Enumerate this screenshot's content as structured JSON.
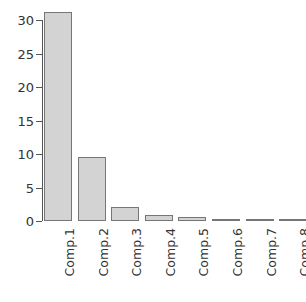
{
  "chart_data": {
    "type": "bar",
    "title": "",
    "subtitle": "",
    "xlabel": "",
    "ylabel": "",
    "categories": [
      "Comp.1",
      "Comp.2",
      "Comp.3",
      "Comp.4",
      "Comp.5",
      "Comp.6",
      "Comp.7",
      "Comp.8",
      "Comp.9",
      "Comp.10"
    ],
    "values": [
      31.2,
      9.5,
      2.1,
      0.85,
      0.62,
      0.3,
      0.25,
      0.18,
      0.12,
      0.08
    ],
    "ylim": [
      0,
      31.5
    ],
    "yticks": [
      0,
      5,
      10,
      15,
      20,
      25,
      30
    ],
    "ytick_labels": [
      "0",
      "5",
      "10",
      "15",
      "20",
      "25",
      "30"
    ],
    "grid": false,
    "legend": null,
    "legend_position": "none",
    "annotations": [],
    "bar_fill_color": "#d3d3d3",
    "bar_border_color": "#767676",
    "axis_color": "#555555",
    "background_color": "#ffffff",
    "x_label_rotation": 90
  }
}
